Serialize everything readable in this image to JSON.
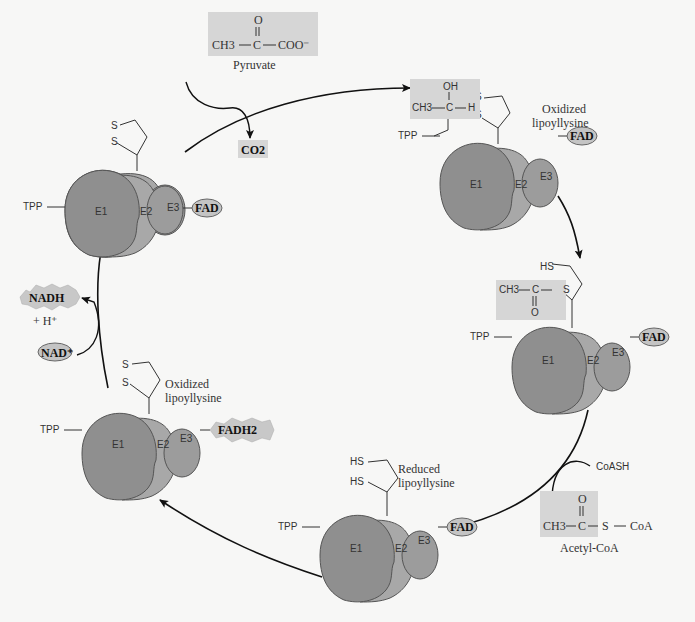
{
  "diagram": {
    "colors": {
      "background": "#f7f7f6",
      "e1": "#8f8f8f",
      "e2": "#a8a8a8",
      "e3": "#9c9c9c",
      "box": "#d6d6d6",
      "cofactor_oval": "#c4c4c4",
      "line": "#222222"
    },
    "substrates": {
      "pyruvate": {
        "formula_left": "CH3",
        "formula_center": "C",
        "formula_right": "COO⁻",
        "carbonyl": "O",
        "label": "Pyruvate"
      },
      "co2": "CO2",
      "coash": "CoASH",
      "acetyl_coa": {
        "formula_left": "CH3",
        "formula_center": "C",
        "s": "S",
        "coa": "CoA",
        "carbonyl": "O",
        "label": "Acetyl-CoA"
      },
      "hydroxyethyl": {
        "oh": "OH",
        "ch3": "CH3",
        "c": "C",
        "h": "H"
      },
      "acetyl_thioester": {
        "ch3": "CH3",
        "c": "C",
        "s": "S",
        "o": "O",
        "hs": "HS"
      }
    },
    "cofactors": {
      "nadh": "NADH",
      "h_plus": "+ H⁺",
      "nad_plus": "NAD⁺",
      "fad": "FAD",
      "fadh2": "FADH2",
      "tpp": "TPP"
    },
    "lipoyl_labels": {
      "oxidized": [
        "Oxidized",
        "lipoyllysine"
      ],
      "reduced": [
        "Reduced",
        "lipoyllysine"
      ],
      "s": "S",
      "hs": "HS"
    },
    "enzymes": {
      "e1": "E1",
      "e2": "E2",
      "e3": "E3",
      "sub": "1",
      "sub2": "2",
      "sub3": "3"
    },
    "complexes": [
      {
        "id": "top-left",
        "x": 95,
        "y": 215,
        "state": "oxidized",
        "cofactor": "FAD"
      },
      {
        "id": "top-right",
        "x": 465,
        "y": 188,
        "state": "oxidized-hydroxyethyl",
        "cofactor": "FAD"
      },
      {
        "id": "right",
        "x": 530,
        "y": 370,
        "state": "acetyl",
        "cofactor": "FAD"
      },
      {
        "id": "bottom",
        "x": 340,
        "y": 555,
        "state": "reduced",
        "cofactor": "FAD"
      },
      {
        "id": "bottom-left",
        "x": 108,
        "y": 455,
        "state": "oxidized",
        "cofactor": "FADH2"
      }
    ]
  }
}
